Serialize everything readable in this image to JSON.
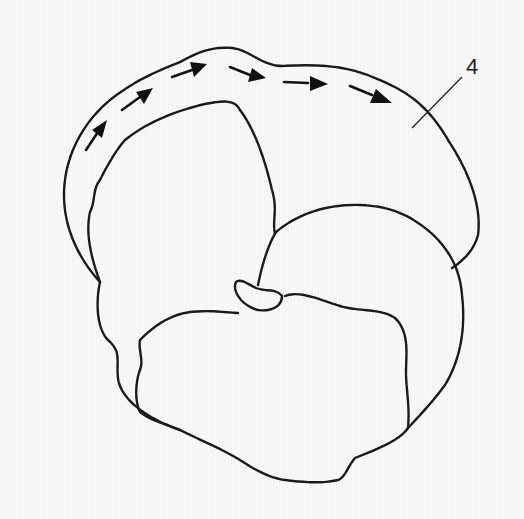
{
  "figure": {
    "type": "anatomical line drawing",
    "background_color": "#f8f8f8",
    "line_color": "#1a1a1a",
    "labels": [
      {
        "id": "label-4",
        "text": "4"
      }
    ],
    "arrows": {
      "count": 6,
      "direction": "clockwise along upper outer contour"
    }
  }
}
